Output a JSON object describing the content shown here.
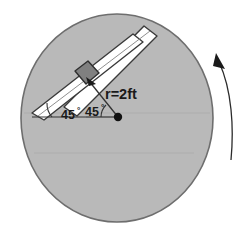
{
  "figure": {
    "canvas": {
      "width": 249,
      "height": 234,
      "background": "#ffffff"
    },
    "disk": {
      "name": "gray-disk",
      "center_x": 117,
      "center_y": 118,
      "radius_x": 96,
      "radius_y": 104,
      "fill": "#b9b9b9",
      "stroke": "#6e6e6e"
    },
    "slot": {
      "name": "diagonal-slot",
      "fill": "#ffffff",
      "stroke": "#3a3a3a",
      "angle_deg": 45,
      "description": "white channel running lower-left to upper-right"
    },
    "collar": {
      "name": "slider-collar",
      "fill": "#808080",
      "stroke": "#2e2e2e",
      "x": 75,
      "y": 66,
      "size": 19
    },
    "pivot": {
      "name": "pivot-point",
      "x": 118,
      "y": 117,
      "radius": 4,
      "fill": "#111111"
    },
    "radius_line": {
      "name": "radius-line",
      "from_x": 118,
      "from_y": 117,
      "to_x": 86,
      "to_y": 78,
      "stroke": "#333333"
    },
    "rotation_arrow": {
      "name": "rotation-arrow",
      "direction": "counter-clockwise",
      "stroke": "#2b2b2b"
    },
    "labels": {
      "radius": "r=2ft",
      "angle_left_value": "45",
      "angle_left_unit": "°",
      "angle_right_value": "45",
      "angle_right_unit": "°"
    }
  }
}
